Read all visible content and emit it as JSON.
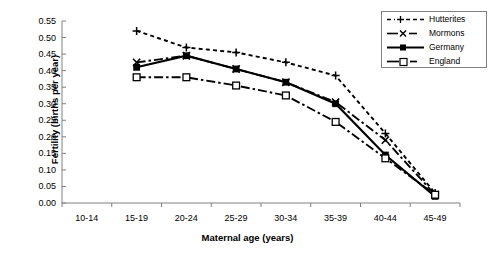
{
  "chart_data": {
    "type": "line",
    "title": "",
    "xlabel": "Maternal age (years)",
    "ylabel": "Fertility (births per year)",
    "categories": [
      "10-14",
      "15-19",
      "20-24",
      "25-29",
      "30-34",
      "35-39",
      "40-44",
      "45-49"
    ],
    "ylim": [
      0.0,
      0.55
    ],
    "ytick_labels": [
      "0.55",
      "0.50",
      "0.45",
      "0.40",
      "0.35",
      "0.30",
      "0.25",
      "0.20",
      "0.15",
      "0.10",
      "0.05",
      "0.00"
    ],
    "ytick_values": [
      0.55,
      0.5,
      0.45,
      0.4,
      0.35,
      0.3,
      0.25,
      0.2,
      0.15,
      0.1,
      0.05,
      0.0
    ],
    "grid": false,
    "legend_position": "top-right",
    "series": [
      {
        "name": "Hutterites",
        "marker": "plus",
        "line_style": "dashed",
        "color": "#000000",
        "x": [
          "15-19",
          "20-24",
          "25-29",
          "30-34",
          "35-39",
          "40-44",
          "45-49"
        ],
        "values": [
          0.52,
          0.47,
          0.455,
          0.425,
          0.385,
          0.21,
          0.03
        ]
      },
      {
        "name": "Mormons",
        "marker": "cross",
        "line_style": "dash-dot",
        "color": "#000000",
        "x": [
          "15-19",
          "20-24",
          "25-29",
          "30-34",
          "35-39",
          "40-44",
          "45-49"
        ],
        "values": [
          0.425,
          0.445,
          0.405,
          0.365,
          0.305,
          0.19,
          0.025
        ]
      },
      {
        "name": "Germany",
        "marker": "filled-square",
        "line_style": "solid",
        "color": "#000000",
        "x": [
          "15-19",
          "20-24",
          "25-29",
          "30-34",
          "35-39",
          "40-44",
          "45-49"
        ],
        "values": [
          0.41,
          0.445,
          0.405,
          0.365,
          0.3,
          0.145,
          0.02
        ]
      },
      {
        "name": "England",
        "marker": "open-square",
        "line_style": "dash-dot",
        "color": "#000000",
        "x": [
          "15-19",
          "20-24",
          "25-29",
          "30-34",
          "35-39",
          "40-44",
          "45-49"
        ],
        "values": [
          0.38,
          0.38,
          0.355,
          0.325,
          0.245,
          0.135,
          0.025
        ]
      }
    ]
  },
  "axes": {
    "y_label": "Fertility (births per year)",
    "x_label": "Maternal age (years)",
    "y_ticks": [
      "0.55",
      "0.50",
      "0.45",
      "0.40",
      "0.35",
      "0.30",
      "0.25",
      "0.20",
      "0.15",
      "0.10",
      "0.05",
      "0.00"
    ],
    "x_ticks": [
      "10-14",
      "15-19",
      "20-24",
      "25-29",
      "30-34",
      "35-39",
      "40-44",
      "45-49"
    ]
  },
  "legend": {
    "items": [
      {
        "label": "Hutterites",
        "marker": "plus-marker"
      },
      {
        "label": "Mormons",
        "marker": "cross-marker"
      },
      {
        "label": "Germany",
        "marker": "filled-square-marker"
      },
      {
        "label": "England",
        "marker": "open-square-marker"
      }
    ]
  }
}
